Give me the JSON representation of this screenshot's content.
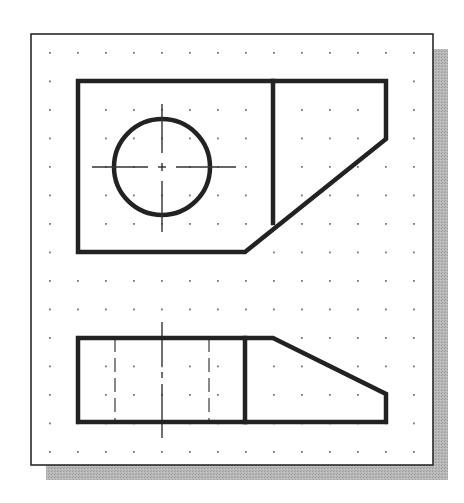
{
  "figure": {
    "colors": {
      "background": "#ffffff",
      "paper": "#ffffff",
      "frame_stroke": "#2a2a2a",
      "shadow": "#b4b4b4",
      "object_line": "#222222",
      "center_line": "#333333",
      "hidden_line": "#555555",
      "grid_dot": "#777777"
    },
    "frame": {
      "x": 31,
      "y": 34,
      "width": 402,
      "height": 431,
      "shadow_offset": 15
    },
    "grid": {
      "x_start": 50,
      "y_start": 53,
      "spacing_x": 28,
      "spacing_y": 28.5,
      "cols": 14,
      "rows": 15
    },
    "top_view": {
      "label": "top-view",
      "outline": [
        [
          78,
          81
        ],
        [
          386,
          81
        ],
        [
          386,
          139
        ],
        [
          245,
          252
        ],
        [
          78,
          252
        ]
      ],
      "divider_line": [
        [
          273,
          81
        ],
        [
          273,
          223
        ]
      ],
      "hole": {
        "cx": 162,
        "cy": 167,
        "r": 48
      },
      "center_line_h": [
        [
          92,
          167
        ],
        [
          236,
          167
        ]
      ],
      "center_line_v": [
        [
          162,
          104
        ],
        [
          162,
          232
        ]
      ]
    },
    "front_view": {
      "label": "front-view",
      "outline": [
        [
          78,
          338
        ],
        [
          273,
          338
        ],
        [
          386,
          394
        ],
        [
          386,
          422
        ],
        [
          78,
          422
        ]
      ],
      "divider_line": [
        [
          245,
          338
        ],
        [
          245,
          422
        ]
      ],
      "hidden_lines": [
        [
          [
            115,
            338
          ],
          [
            115,
            422
          ]
        ],
        [
          [
            209,
            338
          ],
          [
            209,
            422
          ]
        ]
      ],
      "center_line_v": [
        [
          162,
          322
        ],
        [
          162,
          438
        ]
      ]
    }
  }
}
